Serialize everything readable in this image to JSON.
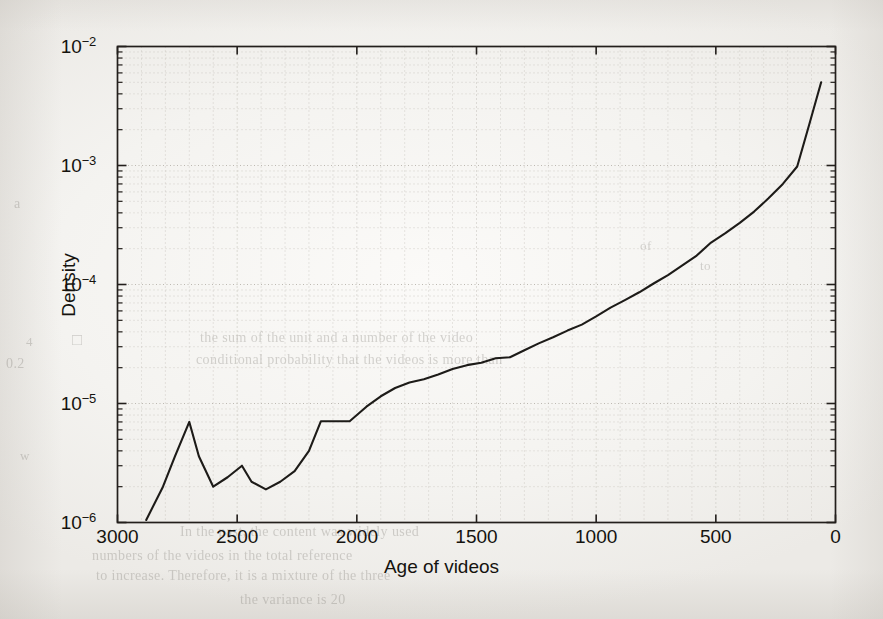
{
  "figure": {
    "background_color": "#f4f3f0",
    "line_color": "#1d1b18",
    "axis_color": "#231f1c",
    "grid_color": "#b9b5ae"
  },
  "chart_data": {
    "type": "line",
    "title": "",
    "xlabel": "Age of videos",
    "ylabel": "Density",
    "xlim": [
      3000,
      0
    ],
    "ylim": [
      1e-06,
      0.01
    ],
    "xscale": "linear",
    "yscale": "log",
    "x_reversed": true,
    "grid": true,
    "grid_style": "dotted-minor",
    "legend": "none",
    "xticks": [
      3000,
      2500,
      2000,
      1500,
      1000,
      500,
      0
    ],
    "xtick_labels": [
      "3000",
      "2500",
      "2000",
      "1500",
      "1000",
      "500",
      "0"
    ],
    "yticks": [
      1e-06,
      1e-05,
      0.0001,
      0.001,
      0.01
    ],
    "ytick_labels": [
      "10−6",
      "10−5",
      "10−4",
      "10−3",
      "10−2"
    ],
    "ytick_mantissa": "10",
    "ytick_exponents": [
      "-6",
      "-5",
      "-4",
      "-3",
      "-2"
    ],
    "series": [
      {
        "name": "density",
        "x": [
          2880,
          2810,
          2760,
          2700,
          2660,
          2600,
          2540,
          2480,
          2440,
          2380,
          2320,
          2260,
          2200,
          2150,
          2090,
          2030,
          1960,
          1900,
          1840,
          1780,
          1720,
          1660,
          1600,
          1540,
          1480,
          1420,
          1360,
          1300,
          1240,
          1180,
          1120,
          1060,
          1000,
          940,
          880,
          820,
          760,
          700,
          640,
          580,
          520,
          460,
          400,
          340,
          280,
          220,
          160,
          110,
          60
        ],
        "y": [
          1.05e-06,
          2e-06,
          3.6e-06,
          7e-06,
          3.6e-06,
          2e-06,
          2.4e-06,
          3e-06,
          2.2e-06,
          1.9e-06,
          2.2e-06,
          2.7e-06,
          4e-06,
          7.1e-06,
          7.1e-06,
          7.1e-06,
          9.4e-06,
          1.15e-05,
          1.35e-05,
          1.5e-05,
          1.6e-05,
          1.75e-05,
          1.95e-05,
          2.1e-05,
          2.2e-05,
          2.4e-05,
          2.45e-05,
          2.8e-05,
          3.2e-05,
          3.6e-05,
          4.1e-05,
          4.6e-05,
          5.4e-05,
          6.4e-05,
          7.4e-05,
          8.6e-05,
          0.000102,
          0.00012,
          0.000145,
          0.000175,
          0.000225,
          0.00027,
          0.00033,
          0.00041,
          0.00053,
          0.0007,
          0.00098,
          0.0022,
          0.005
        ]
      }
    ]
  },
  "ghost_text": [
    {
      "text": "a",
      "x": 14,
      "y": 196,
      "size": 14
    },
    {
      "text": "□",
      "x": 72,
      "y": 330,
      "size": 17
    },
    {
      "text": "0.2",
      "x": 6,
      "y": 356,
      "size": 14
    },
    {
      "text": "4",
      "x": 26,
      "y": 334,
      "size": 13
    },
    {
      "text": "w",
      "x": 20,
      "y": 448,
      "size": 13
    },
    {
      "text": "the sum of the unit and a number of the video",
      "x": 200,
      "y": 330,
      "size": 14
    },
    {
      "text": "conditional probability that the videos is more than",
      "x": 196,
      "y": 352,
      "size": 14
    },
    {
      "text": "In the past, the content was widely used",
      "x": 180,
      "y": 524,
      "size": 14
    },
    {
      "text": "numbers of the videos in the total reference",
      "x": 92,
      "y": 548,
      "size": 14
    },
    {
      "text": "to increase. Therefore, it is a mixture of the three",
      "x": 96,
      "y": 568,
      "size": 14
    },
    {
      "text": "the variance is 20",
      "x": 240,
      "y": 592,
      "size": 14
    },
    {
      "text": "to",
      "x": 700,
      "y": 258,
      "size": 13
    },
    {
      "text": "of",
      "x": 640,
      "y": 238,
      "size": 13
    }
  ]
}
